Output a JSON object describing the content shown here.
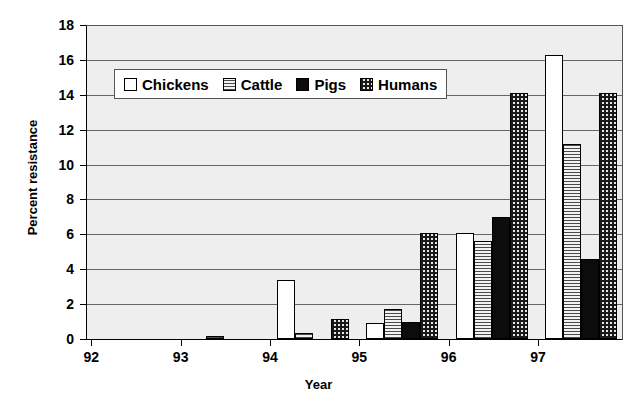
{
  "chart_data": {
    "type": "bar",
    "title": "",
    "xlabel": "Year",
    "ylabel": "Percent resistance",
    "categories": [
      "92",
      "93",
      "94",
      "95",
      "96",
      "97"
    ],
    "ylim": [
      0,
      18
    ],
    "ytick_step": 2,
    "yticks": [
      "18",
      "16",
      "14",
      "12",
      "10",
      "8",
      "6",
      "4",
      "2",
      "0"
    ],
    "grid": true,
    "grid_axis": "y",
    "legend_position": "top-center",
    "series": [
      {
        "name": "Chickens",
        "pattern": "open-white",
        "color": "#ffffff",
        "values": [
          0,
          0,
          3.4,
          0.9,
          6.1,
          16.3
        ]
      },
      {
        "name": "Cattle",
        "pattern": "horizontal-stripes",
        "color": "#d2d2d2",
        "values": [
          0,
          0.2,
          0.35,
          1.7,
          5.6,
          11.2
        ]
      },
      {
        "name": "Pigs",
        "pattern": "solid-black",
        "color": "#0c0c0c",
        "values": [
          0,
          0,
          0,
          0.95,
          7.0,
          4.6
        ]
      },
      {
        "name": "Humans",
        "pattern": "checkerboard",
        "color": "#e8e8e8",
        "values": [
          0,
          0,
          1.15,
          6.1,
          14.1,
          14.1
        ]
      }
    ]
  }
}
